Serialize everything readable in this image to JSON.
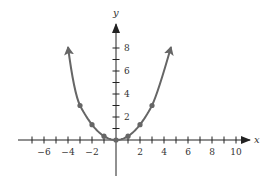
{
  "chart_data": {
    "type": "line",
    "title": "",
    "xlabel": "x",
    "ylabel": "y",
    "xlim": [
      -7.5,
      11
    ],
    "ylim": [
      -2,
      9
    ],
    "grid": false,
    "legend": null,
    "x_ticks": [
      -7,
      -6,
      -5,
      -4,
      -3,
      -2,
      -1,
      1,
      2,
      3,
      4,
      5,
      6,
      7,
      8,
      9,
      10
    ],
    "x_tick_labels": [
      "-6",
      "-4",
      "-2",
      "2",
      "4",
      "6",
      "8",
      "10"
    ],
    "x_tick_label_values": [
      -6,
      -4,
      -2,
      2,
      4,
      6,
      8,
      10
    ],
    "y_ticks": [
      1,
      2,
      3,
      4,
      5,
      6,
      7,
      8
    ],
    "y_tick_labels": [
      "2",
      "4",
      "6",
      "8"
    ],
    "y_tick_label_values": [
      2,
      4,
      6,
      8
    ],
    "series": [
      {
        "name": "parabola",
        "function": "y = x^2/3",
        "curve_x_range": [
          -4.2,
          4.55
        ],
        "arrows_at_ends": true,
        "color": "#666666",
        "points": [
          {
            "x": -3,
            "y": 3
          },
          {
            "x": -2,
            "y": 1.33
          },
          {
            "x": -1,
            "y": 0.33
          },
          {
            "x": 0,
            "y": 0
          },
          {
            "x": 1,
            "y": 0.33
          },
          {
            "x": 2,
            "y": 1.33
          },
          {
            "x": 3,
            "y": 3
          }
        ]
      }
    ],
    "axis_color": "#222222"
  },
  "labels": {
    "x_axis": "x",
    "y_axis": "y"
  }
}
